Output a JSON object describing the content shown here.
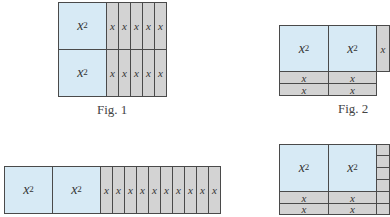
{
  "figures": [
    {
      "id": "fig1",
      "caption": "Fig. 1",
      "tiles": [
        {
          "kind": "sq",
          "label": "x",
          "exp": "2",
          "x": 58,
          "y": 2,
          "w": 49,
          "h": 48
        },
        {
          "kind": "sq",
          "label": "x",
          "exp": "2",
          "x": 58,
          "y": 49,
          "w": 49,
          "h": 48
        },
        {
          "kind": "st",
          "label": "x",
          "x": 106,
          "y": 2,
          "w": 13,
          "h": 48
        },
        {
          "kind": "st",
          "label": "x",
          "x": 118,
          "y": 2,
          "w": 13,
          "h": 48
        },
        {
          "kind": "st",
          "label": "x",
          "x": 130,
          "y": 2,
          "w": 13,
          "h": 48
        },
        {
          "kind": "st",
          "label": "x",
          "x": 142,
          "y": 2,
          "w": 13,
          "h": 48
        },
        {
          "kind": "st",
          "label": "x",
          "x": 154,
          "y": 2,
          "w": 13,
          "h": 48
        },
        {
          "kind": "st",
          "label": "x",
          "x": 106,
          "y": 49,
          "w": 13,
          "h": 48
        },
        {
          "kind": "st",
          "label": "x",
          "x": 118,
          "y": 49,
          "w": 13,
          "h": 48
        },
        {
          "kind": "st",
          "label": "x",
          "x": 130,
          "y": 49,
          "w": 13,
          "h": 48
        },
        {
          "kind": "st",
          "label": "x",
          "x": 142,
          "y": 49,
          "w": 13,
          "h": 48
        },
        {
          "kind": "st",
          "label": "x",
          "x": 154,
          "y": 49,
          "w": 13,
          "h": 48
        }
      ],
      "caption_pos": {
        "x": 97,
        "y": 102
      }
    },
    {
      "id": "fig2",
      "caption": "Fig. 2",
      "tiles": [
        {
          "kind": "sq",
          "label": "x",
          "exp": "2",
          "x": 279,
          "y": 25,
          "w": 50,
          "h": 47
        },
        {
          "kind": "sq",
          "label": "x",
          "exp": "2",
          "x": 328,
          "y": 25,
          "w": 49,
          "h": 47
        },
        {
          "kind": "st",
          "label": "x",
          "x": 376,
          "y": 25,
          "w": 14,
          "h": 47
        },
        {
          "kind": "st",
          "label": "x",
          "x": 279,
          "y": 71,
          "w": 50,
          "h": 13
        },
        {
          "kind": "st",
          "label": "x",
          "x": 328,
          "y": 71,
          "w": 49,
          "h": 13
        },
        {
          "kind": "st",
          "label": "x",
          "x": 279,
          "y": 83,
          "w": 50,
          "h": 13
        },
        {
          "kind": "st",
          "label": "x",
          "x": 328,
          "y": 83,
          "w": 49,
          "h": 13
        }
      ],
      "caption_pos": {
        "x": 338,
        "y": 101
      }
    },
    {
      "id": "fig3",
      "caption": "",
      "tiles": [
        {
          "kind": "sq",
          "label": "x",
          "exp": "2",
          "x": 4,
          "y": 166,
          "w": 49,
          "h": 48
        },
        {
          "kind": "sq",
          "label": "x",
          "exp": "2",
          "x": 52,
          "y": 166,
          "w": 49,
          "h": 48
        },
        {
          "kind": "st",
          "label": "x",
          "x": 100,
          "y": 166,
          "w": 13,
          "h": 48
        },
        {
          "kind": "st",
          "label": "x",
          "x": 112,
          "y": 166,
          "w": 13,
          "h": 48
        },
        {
          "kind": "st",
          "label": "x",
          "x": 124,
          "y": 166,
          "w": 13,
          "h": 48
        },
        {
          "kind": "st",
          "label": "x",
          "x": 136,
          "y": 166,
          "w": 13,
          "h": 48
        },
        {
          "kind": "st",
          "label": "x",
          "x": 148,
          "y": 166,
          "w": 13,
          "h": 48
        },
        {
          "kind": "st",
          "label": "x",
          "x": 160,
          "y": 166,
          "w": 13,
          "h": 48
        },
        {
          "kind": "st",
          "label": "x",
          "x": 172,
          "y": 166,
          "w": 13,
          "h": 48
        },
        {
          "kind": "st",
          "label": "x",
          "x": 184,
          "y": 166,
          "w": 13,
          "h": 48
        },
        {
          "kind": "st",
          "label": "x",
          "x": 196,
          "y": 166,
          "w": 13,
          "h": 48
        },
        {
          "kind": "st",
          "label": "x",
          "x": 208,
          "y": 166,
          "w": 13,
          "h": 48
        }
      ]
    },
    {
      "id": "fig4",
      "caption": "",
      "tiles": [
        {
          "kind": "sq",
          "label": "x",
          "exp": "2",
          "x": 279,
          "y": 144,
          "w": 50,
          "h": 48
        },
        {
          "kind": "sq",
          "label": "x",
          "exp": "2",
          "x": 328,
          "y": 144,
          "w": 49,
          "h": 48
        },
        {
          "kind": "st",
          "label": "x",
          "x": 279,
          "y": 191,
          "w": 50,
          "h": 13
        },
        {
          "kind": "st",
          "label": "x",
          "x": 328,
          "y": 191,
          "w": 49,
          "h": 13
        },
        {
          "kind": "st",
          "label": "x",
          "x": 279,
          "y": 203,
          "w": 50,
          "h": 12
        },
        {
          "kind": "st",
          "label": "x",
          "x": 328,
          "y": 203,
          "w": 49,
          "h": 12
        },
        {
          "kind": "st",
          "label": "",
          "x": 376,
          "y": 144,
          "w": 14,
          "h": 12
        },
        {
          "kind": "st",
          "label": "",
          "x": 376,
          "y": 155,
          "w": 14,
          "h": 13
        },
        {
          "kind": "st",
          "label": "",
          "x": 376,
          "y": 167,
          "w": 14,
          "h": 13
        },
        {
          "kind": "st",
          "label": "",
          "x": 376,
          "y": 179,
          "w": 14,
          "h": 13
        },
        {
          "kind": "st",
          "label": "",
          "x": 376,
          "y": 191,
          "w": 14,
          "h": 13
        },
        {
          "kind": "st",
          "label": "",
          "x": 376,
          "y": 203,
          "w": 14,
          "h": 12
        }
      ]
    }
  ],
  "colors": {
    "square_fill": "#d7eaf5",
    "strip_fill": "#d3d3d3",
    "border": "#4a4a4a"
  }
}
